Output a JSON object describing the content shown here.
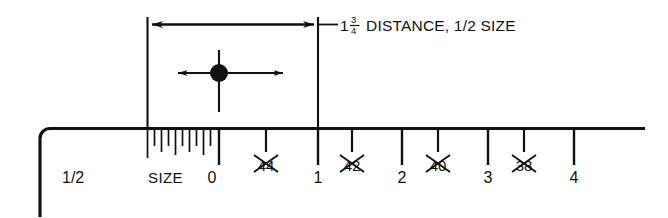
{
  "diagram": {
    "type": "technical-illustration",
    "callout": {
      "whole_number": "1",
      "fraction_numerator": "3",
      "fraction_denominator": "4",
      "text": "DISTANCE, 1/2 SIZE",
      "full_text": "1 3/4 DISTANCE, 1/2 SIZE"
    },
    "ruler": {
      "half_size_label": "1/2",
      "size_label": "SIZE",
      "zero_label": "0",
      "primary_ticks": [
        {
          "label": "0",
          "x": 219,
          "struck": false
        },
        {
          "label": "1",
          "x": 318,
          "struck": false
        },
        {
          "label": "2",
          "x": 402,
          "struck": false
        },
        {
          "label": "3",
          "x": 488,
          "struck": false
        },
        {
          "label": "4",
          "x": 574,
          "struck": false
        }
      ],
      "struck_ticks": [
        {
          "label": "44",
          "x": 266,
          "struck": true
        },
        {
          "label": "42",
          "x": 352,
          "struck": true
        },
        {
          "label": "40",
          "x": 438,
          "struck": true
        },
        {
          "label": "38",
          "x": 524,
          "struck": true
        }
      ]
    },
    "center_marker": {
      "name": "center-point",
      "x": 219,
      "y": 73,
      "radius": 9
    },
    "colors": {
      "ink": "#111111",
      "background": "#ffffff"
    }
  }
}
